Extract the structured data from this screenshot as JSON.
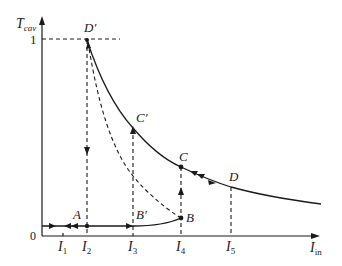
{
  "diagram": {
    "y_axis": {
      "label_main": "T",
      "label_sub": "cav",
      "tick_one": "1",
      "origin": "0"
    },
    "x_axis": {
      "label_main": "I",
      "label_sub": "in"
    },
    "x_ticks": [
      {
        "main": "I",
        "sub": "1"
      },
      {
        "main": "I",
        "sub": "2"
      },
      {
        "main": "I",
        "sub": "3"
      },
      {
        "main": "I",
        "sub": "4"
      },
      {
        "main": "I",
        "sub": "5"
      }
    ],
    "points": {
      "A": "A",
      "B": "B",
      "B_prime": "B′",
      "C": "C",
      "C_prime": "C′",
      "D": "D",
      "D_prime": "D′"
    }
  }
}
